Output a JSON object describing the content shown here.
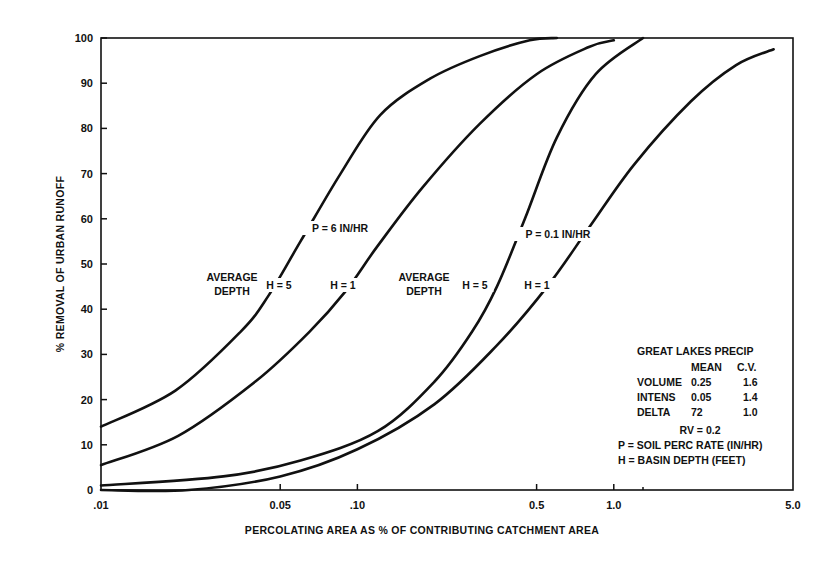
{
  "chart_data": {
    "type": "line",
    "title": "",
    "xlabel": "PERCOLATING AREA AS % OF CONTRIBUTING CATCHMENT AREA",
    "ylabel": "% REMOVAL OF URBAN RUNOFF",
    "xscale": "log",
    "xlim": [
      0.01,
      5.0
    ],
    "ylim": [
      0,
      100
    ],
    "x_ticks": [
      {
        "value": 0.01,
        "label": ".01"
      },
      {
        "value": 0.05,
        "label": "0.05"
      },
      {
        "value": 0.1,
        "label": ".10"
      },
      {
        "value": 0.5,
        "label": "0.5"
      },
      {
        "value": 1.0,
        "label": "1.0"
      },
      {
        "value": 5.0,
        "label": "5.0"
      }
    ],
    "x_minor_ticks": [
      1.3
    ],
    "y_ticks": [
      0,
      10,
      20,
      30,
      40,
      50,
      60,
      70,
      80,
      90,
      100
    ],
    "grid": false,
    "series": [
      {
        "name": "P = 6 IN/HR, H = 5",
        "x": [
          0.01,
          0.0195,
          0.035,
          0.045,
          0.06,
          0.086,
          0.123,
          0.192,
          0.3,
          0.47,
          0.6
        ],
        "y": [
          14,
          22,
          35,
          43,
          55,
          70,
          83,
          91,
          96,
          99.5,
          100
        ]
      },
      {
        "name": "P = 6 IN/HR, H = 1",
        "x": [
          0.01,
          0.02,
          0.04,
          0.065,
          0.09,
          0.12,
          0.18,
          0.3,
          0.5,
          0.8,
          1.0
        ],
        "y": [
          5.5,
          12,
          24,
          35,
          44,
          54,
          67,
          81,
          92,
          98,
          99.5
        ]
      },
      {
        "name": "P = 0.1 IN/HR, H = 5",
        "x": [
          0.01,
          0.03,
          0.06,
          0.12,
          0.2,
          0.28,
          0.35,
          0.45,
          0.6,
          0.85,
          1.3
        ],
        "y": [
          1,
          3,
          6.5,
          13,
          24,
          35,
          45,
          60,
          78,
          92,
          100
        ]
      },
      {
        "name": "P = 0.1 IN/HR, H = 1",
        "x": [
          0.01,
          0.022,
          0.05,
          0.1,
          0.2,
          0.35,
          0.55,
          0.8,
          1.2,
          2.0,
          3.0,
          4.2
        ],
        "y": [
          0,
          0,
          3,
          9,
          19,
          32,
          45,
          58,
          72,
          86,
          94,
          97.5
        ]
      }
    ],
    "annotations": [
      {
        "text": "P = 6 IN/HR",
        "x": 0.13,
        "y": 57
      },
      {
        "text": "AVERAGE",
        "x": 0.032,
        "y": 46
      },
      {
        "text": "DEPTH",
        "x": 0.032,
        "y": 42
      },
      {
        "text": "H = 5",
        "x": 0.05,
        "y": 44
      },
      {
        "text": "H = 1",
        "x": 0.1,
        "y": 44
      },
      {
        "text": "P = 0.1 IN/HR",
        "x": 0.8,
        "y": 57
      },
      {
        "text": "AVERAGE",
        "x": 0.24,
        "y": 46
      },
      {
        "text": "DEPTH",
        "x": 0.24,
        "y": 42
      },
      {
        "text": "H = 5",
        "x": 0.38,
        "y": 44
      },
      {
        "text": "H = 1",
        "x": 0.65,
        "y": 44
      }
    ],
    "legend": {
      "title": "GREAT LAKES PRECIP",
      "columns": [
        "",
        "MEAN",
        "C.V."
      ],
      "rows": [
        [
          "VOLUME",
          "0.25",
          "1.6"
        ],
        [
          "INTENS",
          "0.05",
          "1.4"
        ],
        [
          "DELTA",
          "72",
          "1.0"
        ]
      ],
      "notes": [
        "RV = 0.2",
        "P = SOIL PERC RATE (IN/HR)",
        "H = BASIN DEPTH (FEET)"
      ],
      "position": "lower right"
    }
  }
}
